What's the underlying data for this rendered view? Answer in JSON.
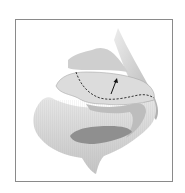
{
  "figure": {
    "annotations": [
      {
        "type": "dashed-line",
        "description": "incision line across lateral crus"
      },
      {
        "type": "arrow",
        "direction": "up",
        "description": "direction of cartilage movement"
      }
    ],
    "colors": {
      "frame": "#8a8a8a",
      "line": "#222222",
      "shading_dark": "#8f8f8f",
      "shading_light": "#d9d9d9"
    }
  }
}
